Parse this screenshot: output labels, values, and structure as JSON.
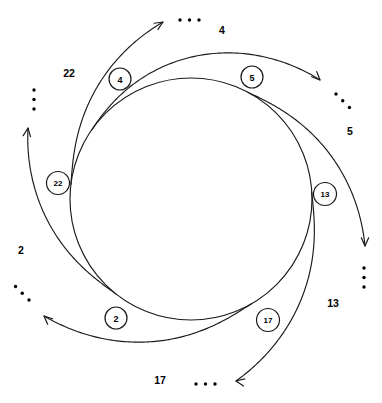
{
  "diagram": {
    "type": "circular-ring-spiral",
    "title": "",
    "center": {
      "x": 191,
      "y": 199
    },
    "inner_radius": 121,
    "colors": {
      "stroke": "#1a1a1a",
      "node_fill": "#ffffff",
      "text": "#000000",
      "background": "#ffffff"
    },
    "ellipsis_glyph": "...",
    "nodes": [
      {
        "id": "node-4",
        "label": "4",
        "cx": 120,
        "cy": 79,
        "r": 11,
        "angle_deg": 215
      },
      {
        "id": "node-5",
        "label": "5",
        "cx": 252,
        "cy": 77,
        "r": 11,
        "angle_deg": 298
      },
      {
        "id": "node-13",
        "label": "13",
        "cx": 325,
        "cy": 194,
        "r": 11.5,
        "angle_deg": 357
      },
      {
        "id": "node-17",
        "label": "17",
        "cx": 268,
        "cy": 320,
        "r": 11.5,
        "angle_deg": 60
      },
      {
        "id": "node-2",
        "label": "2",
        "cx": 116,
        "cy": 318,
        "r": 11,
        "angle_deg": 128
      },
      {
        "id": "node-22",
        "label": "22",
        "cx": 58,
        "cy": 183,
        "r": 11.5,
        "angle_deg": 187
      }
    ],
    "edges": [
      {
        "id": "edge-22",
        "label": "22",
        "from_node": "node-22",
        "label_x": 69,
        "label_y": 73,
        "arrow_x": 163,
        "arrow_y": 22,
        "arrow_dir_deg": -32,
        "ellipsis_x": 180,
        "ellipsis_y": 20,
        "ellipsis_angle_deg": 0
      },
      {
        "id": "edge-4",
        "label": "4",
        "from_node": "node-4",
        "label_x": 222,
        "label_y": 30,
        "arrow_x": 320,
        "arrow_y": 80,
        "arrow_dir_deg": 45,
        "ellipsis_x": 336,
        "ellipsis_y": 94,
        "ellipsis_angle_deg": 45
      },
      {
        "id": "edge-5",
        "label": "5",
        "from_node": "node-5",
        "label_x": 350,
        "label_y": 131,
        "arrow_x": 365,
        "arrow_y": 246,
        "arrow_dir_deg": 90,
        "ellipsis_x": 364,
        "ellipsis_y": 268,
        "ellipsis_angle_deg": 90
      },
      {
        "id": "edge-13",
        "label": "13",
        "from_node": "node-13",
        "label_x": 333,
        "label_y": 303,
        "arrow_x": 236,
        "arrow_y": 381,
        "arrow_dir_deg": 190,
        "ellipsis_x": 215,
        "ellipsis_y": 384,
        "ellipsis_angle_deg": 180
      },
      {
        "id": "edge-17",
        "label": "17",
        "from_node": "node-17",
        "label_x": 160,
        "label_y": 380,
        "arrow_x": 44,
        "arrow_y": 316,
        "arrow_dir_deg": 222,
        "ellipsis_x": 29,
        "ellipsis_y": 300,
        "ellipsis_angle_deg": 225
      },
      {
        "id": "edge-2",
        "label": "2",
        "from_node": "node-2",
        "label_x": 21,
        "label_y": 250,
        "arrow_x": 28,
        "arrow_y": 128,
        "arrow_dir_deg": 278,
        "ellipsis_x": 34,
        "ellipsis_y": 109,
        "ellipsis_angle_deg": 270
      }
    ]
  }
}
